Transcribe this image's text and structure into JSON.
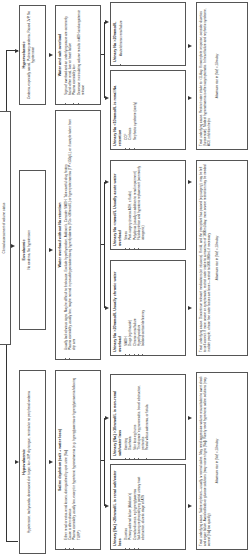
{
  "header": {
    "label": "Clinical assessment of volume status"
  },
  "volume_status": [
    {
      "title": "Hypovolaemic",
      "desc": "Hypotension, tachycardia, decreased skin turgor, low JVP, dry tongue, minimal or no peripheral oedema"
    },
    {
      "title": "Euvolaemic",
      "desc": "No oedema, No hypotension"
    },
    {
      "title": "Hypervolaemic",
      "desc": "Oedema, especially sacral, Pulmonary oedema, Raised JVP, No hypotension"
    }
  ],
  "diagnosis": [
    {
      "title": "Saline depletion (salt + water loss)",
      "bullets": [
        "Either renal or extra-renal losses, distinguished by spot urine [Na]",
        "Cause is often obvious",
        "Plasma osmolality usually low, except in hypertonic hyponatraemia (e.g. hyperglycaemia or hyperglycinaemia following TURP)"
      ]
    },
    {
      "title": "Water overload without Na retention",
      "bullets": [
        "Usually lack obvious signs. May be difficult to find cause. Exclude hypothyroidism, Addison's. Consider SIADH. Take careful drug history",
        "Plasma osmolality usually low; maybe normal in pseudohyponatraemia eg hyperlipidaemia (TGs >30mmol/L) or hyperproteinaemia (TP >150g/L), or if sample taken from drip arm"
      ]
    },
    {
      "title": "Water and salt overload",
      "bullets": [
        "Signs of overload and an underlying cause are commonly found: often renal, liver or heart failure",
        "Plasma osmolality low",
        "Decrease in circulating volume results in ADH and angiotensin release"
      ]
    }
  ],
  "urinary": [
    {
      "title": "Urinary [Na] <20mmol/L is renal salt/water loss",
      "bullets": [
        "Diuretics",
        "Primary adrenal failure (Addison's)",
        "Osmolar diuresis, eg hyperglycaemia",
        "Salt-losing nephropathy eg partial urinary tract obstruction, diuretic stage of ATN"
      ]
    },
    {
      "title": "Urinary [Na] >10mmol/L is non-renal salt/water loss",
      "bullets": [
        "Vomiting",
        "Diarrhoea",
        "Skin loss eg burns",
        "'Third space' eg pancreatitis, bowel obstruction, peritonitis",
        "Rectal villous adenoma, or fistula"
      ]
    },
    {
      "title": "Urinary Na >20mmol/L Usually chronic water overload",
      "bullets": [
        "SIADH",
        "Drugs (eg thiazide)",
        "Chronic renal failure",
        "Hypothyroidism",
        "Isolated cortisol deficiency"
      ]
    },
    {
      "title": "Urinary Na <mmol/L Usually acute water overload",
      "bullets": [
        "Stress",
        "Post-surgery (excess ADH, ± fluids)",
        "Polydipsia (usually in addition to renal impairment)",
        "Fluid depletion and hypotonic replacement (commonly iatrogenic)"
      ]
    },
    {
      "title": "Urinary Na <10mmol/L is renal Na retention",
      "bullets": [
        "CCF",
        "Cirrhosis",
        "Nephrotic syndrome (rarely)"
      ]
    },
    {
      "title": "Urinary Na >20mmol/L",
      "bullets": [
        "Acute/chronic renal failure"
      ]
    }
  ],
  "treatment": [
    {
      "text": "Treat underlying cause. Saline repletion—usually iv normal saline. May need aggressive volume resuscitation to avert shock and organ failure. Avoid colloids or glucose solutions (may worsen hypo [Na]). Rarely need hypertonic saline solutions (may correct [Na] too quickly)",
      "max_rate": "Maximum rise in [Na] = 10m/day"
    },
    {
      "text": "Treat underlying cause. Discontinue relevant medications (or infusions). If mild, and the precipitant has passed (eg surgery), may be left to self-correct. If more severe or symptomatic, restrict water intake to a maximum of 1000mL/day; more severe restriction may be needed in older people, whose free water losses are lower—restrict to 500–800mL if necessary",
      "max_rate": "Maximum rise in [Na] = 10m/day"
    },
    {
      "text": "Treat underlying cause. Restrict water intake to <1L/day. If incomplete response, consider diuretics (furosemide). Modest hyponatraemia is often asymptomatic. In heart failure and nephrotic syndrome, ACE inhibition helps",
      "max_rate": "Maximum rise in [Na] = 10m/day"
    }
  ],
  "colors": {
    "border": "#555555",
    "text": "#333333",
    "background": "#ffffff"
  }
}
